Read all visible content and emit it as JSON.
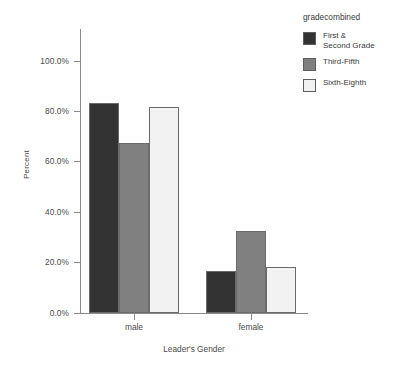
{
  "chart_data": {
    "type": "bar",
    "title": "",
    "xlabel": "Leader's Gender",
    "ylabel": "Percent",
    "categories": [
      "male",
      "female"
    ],
    "series": [
      {
        "name": "First &\nSecond Grade",
        "values": [
          83.4,
          16.6
        ],
        "color": "#333333"
      },
      {
        "name": "Third-Fifth",
        "values": [
          67.5,
          32.5
        ],
        "color": "#808080"
      },
      {
        "name": "Sixth-Eighth",
        "values": [
          81.7,
          18.3
        ],
        "color": "#f2f2f2"
      }
    ],
    "ylim": [
      0,
      100
    ],
    "yticks": [
      0,
      20,
      40,
      60,
      80,
      100
    ],
    "ytick_labels": [
      "0.0%",
      "20.0%",
      "40.0%",
      "60.0%",
      "80.0%",
      "100.0%"
    ],
    "grid": false,
    "legend_position": "right",
    "legend_title": "gradecombined"
  },
  "legend": {
    "title": "gradecombined",
    "items": [
      {
        "label": "First &\nSecond Grade",
        "color": "#333333"
      },
      {
        "label": "Third-Fifth",
        "color": "#808080"
      },
      {
        "label": "Sixth-Eighth",
        "color": "#f2f2f2"
      }
    ]
  },
  "axes": {
    "y_title": "Percent",
    "x_title": "Leader's Gender",
    "y_labels": [
      "100.0%",
      "80.0%",
      "60.0%",
      "40.0%",
      "20.0%",
      "0.0%"
    ],
    "x_labels": [
      "male",
      "female"
    ]
  }
}
